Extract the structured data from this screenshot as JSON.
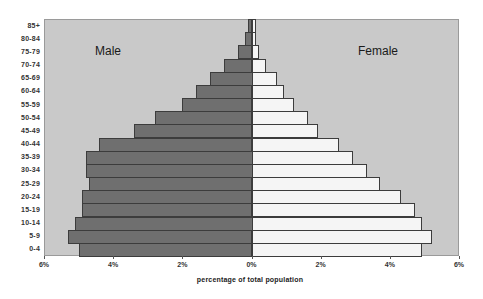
{
  "chart_data": {
    "type": "bar",
    "orientation": "horizontal",
    "subtype": "population-pyramid",
    "title": "",
    "xlabel": "percentage  of total population",
    "ylabel": "",
    "categories": [
      "0-4",
      "5-9",
      "10-14",
      "15-19",
      "20-24",
      "25-29",
      "30-34",
      "35-39",
      "40-44",
      "45-49",
      "50-54",
      "55-59",
      "60-64",
      "65-69",
      "70-74",
      "75-79",
      "80-84",
      "85+"
    ],
    "series": [
      {
        "name": "Male",
        "color": "#6f6f6f",
        "values": [
          5.0,
          5.3,
          5.1,
          4.9,
          4.9,
          4.7,
          4.8,
          4.8,
          4.4,
          3.4,
          2.8,
          2.0,
          1.6,
          1.2,
          0.8,
          0.4,
          0.2,
          0.1
        ]
      },
      {
        "name": "Female",
        "color": "#f5f5f5",
        "values": [
          4.9,
          5.2,
          4.9,
          4.7,
          4.3,
          3.7,
          3.3,
          2.9,
          2.5,
          1.9,
          1.6,
          1.2,
          0.9,
          0.7,
          0.4,
          0.2,
          0.1,
          0.1
        ]
      }
    ],
    "xlim": [
      -6,
      6
    ],
    "x_ticks": [
      "6%",
      "4%",
      "2%",
      "0%",
      "2%",
      "4%",
      "6%"
    ],
    "x_tick_values": [
      -6,
      -4,
      -2,
      0,
      2,
      4,
      6
    ],
    "grid": false,
    "legend": "inline labels (Male left, Female right)",
    "plot_background": "#c9c9c9"
  },
  "labels": {
    "male": "Male",
    "female": "Female",
    "x_axis": "percentage  of total population"
  }
}
